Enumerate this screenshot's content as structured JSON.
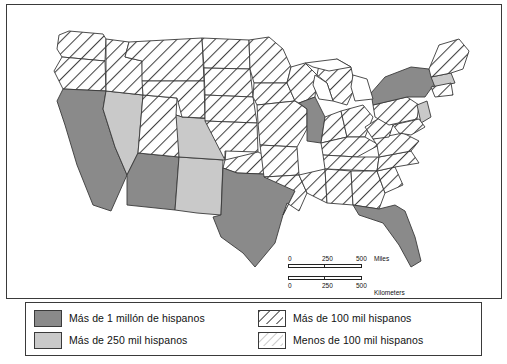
{
  "map": {
    "title": "Mapa de poblacion hispana en Estados Unidos",
    "colors": {
      "more_than_1_million": "#8a8a8a",
      "more_than_250k": "#c9c9c9",
      "more_than_100k_hatch": "#555555",
      "less_than_100k": "#ffffff",
      "outline": "#3a3a3a",
      "water": "#ffffff"
    },
    "categories": {
      "more_than_1_million": [
        "CA",
        "TX",
        "FL",
        "NY",
        "IL",
        "AZ"
      ],
      "more_than_250k": [
        "NV",
        "NM",
        "CO",
        "NJ",
        "MA"
      ],
      "more_than_100k": [
        "WA",
        "OR",
        "ID",
        "UT",
        "MT",
        "WY",
        "ND",
        "SD",
        "NE",
        "KS",
        "OK",
        "MN",
        "IA",
        "MO",
        "AR",
        "LA",
        "WI",
        "IN",
        "OH",
        "MI",
        "KY",
        "TN",
        "MS",
        "AL",
        "GA",
        "SC",
        "NC",
        "VA",
        "WV",
        "PA",
        "MD",
        "DE",
        "CT",
        "RI",
        "VT",
        "NH",
        "ME"
      ],
      "less_than_100k": [
        "Resto"
      ]
    }
  },
  "scale": {
    "miles": {
      "start": "0",
      "mid": "250",
      "end": "500",
      "unit": "Miles"
    },
    "kilometers": {
      "start": "0",
      "mid": "250",
      "end": "500",
      "unit": "Kilometers"
    }
  },
  "legend": {
    "items": [
      {
        "label": "Más de 1 millón de hispanos",
        "style": "solid-dark"
      },
      {
        "label": "Más de 100 mil hispanos",
        "style": "hatched"
      },
      {
        "label": "Más de 250 mil hispanos",
        "style": "solid-light"
      },
      {
        "label": "Menos de 100 mil hispanos",
        "style": "fine-hatched"
      }
    ]
  }
}
